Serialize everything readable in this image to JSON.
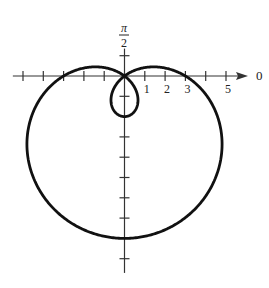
{
  "chart_data": {
    "type": "line",
    "coordinate_system": "polar",
    "equation": "r = 3 - 5 sin(theta)",
    "curve": "limacon with inner loop",
    "theta_range": [
      0,
      6.283185307
    ],
    "polar_axis_label": "0",
    "vertical_axis_label": {
      "numerator": "π",
      "denominator": "2"
    },
    "x_tick_labels": [
      {
        "value": 1,
        "label": "1"
      },
      {
        "value": 2,
        "label": "2"
      },
      {
        "value": 3,
        "label": "3"
      },
      {
        "value": 5,
        "label": "5"
      }
    ],
    "x_ticks": [
      -5,
      -4,
      -3,
      -2,
      -1,
      1,
      2,
      3,
      4,
      5
    ],
    "y_ticks": [
      1,
      -1,
      -3,
      -4,
      -5,
      -6,
      -7,
      -9
    ],
    "x_range": [
      -5.5,
      6.1
    ],
    "y_range": [
      -9.7,
      1.35
    ],
    "grid": false,
    "colors": {
      "curve": "#111111",
      "axis": "#333333"
    }
  }
}
